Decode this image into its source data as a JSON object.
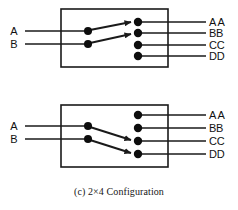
{
  "figure": {
    "caption": "(c) 2×4 Configuration",
    "stroke_color": "#1a1a1a",
    "background_color": "#ffffff",
    "panels": [
      {
        "id": "panel-top",
        "state_name": "bar-state",
        "inputs": [
          {
            "label": "A",
            "line_y": 31
          },
          {
            "label": "B",
            "line_y": 44
          }
        ],
        "outputs": [
          {
            "label": "AA",
            "line_y": 22
          },
          {
            "label": "BB",
            "line_y": 33
          },
          {
            "label": "CC",
            "line_y": 45
          },
          {
            "label": "DD",
            "line_y": 56
          }
        ],
        "box": {
          "x": 61,
          "y": 9,
          "w": 107,
          "h": 58
        },
        "switch_nodes": [
          {
            "x": 88,
            "y": 31
          },
          {
            "x": 88,
            "y": 44
          }
        ],
        "output_nodes": [
          {
            "x": 138,
            "y": 22
          },
          {
            "x": 138,
            "y": 33
          },
          {
            "x": 138,
            "y": 45
          },
          {
            "x": 138,
            "y": 56
          }
        ],
        "connections": [
          {
            "from": "A",
            "to": "AA",
            "x1": 90,
            "y1": 30,
            "x2": 131,
            "y2": 22
          },
          {
            "from": "B",
            "to": "BB",
            "x1": 90,
            "y1": 43,
            "x2": 131,
            "y2": 34
          }
        ]
      },
      {
        "id": "panel-bottom",
        "state_name": "cross-state",
        "inputs": [
          {
            "label": "A",
            "line_y": 126
          },
          {
            "label": "B",
            "line_y": 139
          }
        ],
        "outputs": [
          {
            "label": "AA",
            "line_y": 115
          },
          {
            "label": "BB",
            "line_y": 128
          },
          {
            "label": "CC",
            "line_y": 141
          },
          {
            "label": "DD",
            "line_y": 154
          }
        ],
        "box": {
          "x": 61,
          "y": 105,
          "w": 107,
          "h": 62
        },
        "switch_nodes": [
          {
            "x": 88,
            "y": 126
          },
          {
            "x": 88,
            "y": 139
          }
        ],
        "output_nodes": [
          {
            "x": 138,
            "y": 115
          },
          {
            "x": 138,
            "y": 128
          },
          {
            "x": 138,
            "y": 141
          },
          {
            "x": 138,
            "y": 154
          }
        ],
        "connections": [
          {
            "from": "A",
            "to": "CC",
            "x1": 90,
            "y1": 127,
            "x2": 131,
            "y2": 140
          },
          {
            "from": "B",
            "to": "DD",
            "x1": 90,
            "y1": 140,
            "x2": 131,
            "y2": 153
          }
        ]
      }
    ]
  }
}
